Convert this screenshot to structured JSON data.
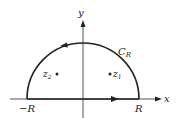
{
  "diagram": {
    "type": "contour",
    "title": "",
    "labels": {
      "y_axis": "y",
      "x_axis": "x",
      "contour": "C",
      "contour_sub": "R",
      "neg_r": "−R",
      "pos_r": "R",
      "z1": "z",
      "z1_sub": "1",
      "z2": "z",
      "z2_sub": "2"
    },
    "colors": {
      "stroke": "#222222",
      "axis": "#444444"
    }
  }
}
